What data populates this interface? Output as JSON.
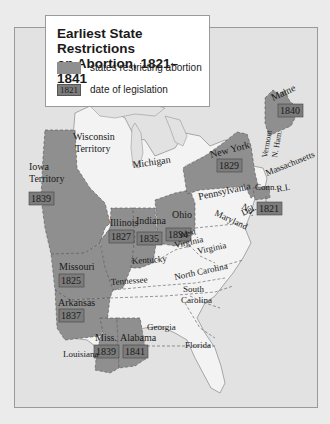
{
  "legend": {
    "title_line1": "Earliest State Restrictions",
    "title_line2": "on Abortion, 1821–1841",
    "items": [
      {
        "label": "states restricting abortion",
        "swatch": "fill"
      },
      {
        "label": "date of legislation",
        "swatch": "date",
        "sample": "1821"
      }
    ]
  },
  "colors": {
    "restricting_state": "#8f8f8f",
    "date_box": "#7c7c7c",
    "other_state": "#f3f3f3",
    "water": "#e2e2e2",
    "page_bg": "#ebebeb"
  },
  "restricting_states": [
    {
      "name": "Iowa Territory",
      "line1": "Iowa",
      "line2": "Territory",
      "year": "1839"
    },
    {
      "name": "Illinois",
      "line1": "Illinois",
      "year": "1827"
    },
    {
      "name": "Indiana",
      "line1": "Indiana",
      "year": "1835"
    },
    {
      "name": "Ohio",
      "line1": "Ohio",
      "year": "1834"
    },
    {
      "name": "Missouri",
      "line1": "Missouri",
      "year": "1825"
    },
    {
      "name": "Arkansas",
      "line1": "Arkansas",
      "year": "1837"
    },
    {
      "name": "Mississippi",
      "line1": "Miss.",
      "year": "1839"
    },
    {
      "name": "Alabama",
      "line1": "Alabama",
      "year": "1841"
    },
    {
      "name": "New York",
      "line1": "New York",
      "year": "1829"
    },
    {
      "name": "Maine",
      "line1": "Maine",
      "year": "1840"
    },
    {
      "name": "Connecticut",
      "line1": "Conn.",
      "year": "1821"
    }
  ],
  "other_labels": {
    "wisconsin_1": "Wisconsin",
    "wisconsin_2": "Territory",
    "michigan": "Michigan",
    "pennsylvania": "Pennsylvania",
    "vermont": "Vermont",
    "nh": "N. Ham.",
    "massachusetts": "Massachusetts",
    "ri": "R.I.",
    "nj": "N.J.",
    "maryland": "Maryland",
    "delaware": "Del.",
    "west_virginia_1": "West",
    "west_virginia_2": "Virginia",
    "virginia": "Virginia",
    "kentucky": "Kentucky",
    "tennessee": "Tennessee",
    "north_carolina": "North Carolina",
    "south_carolina_1": "South",
    "south_carolina_2": "Carolina",
    "georgia": "Georgia",
    "louisiana": "Louisiana",
    "florida": "Florida"
  }
}
